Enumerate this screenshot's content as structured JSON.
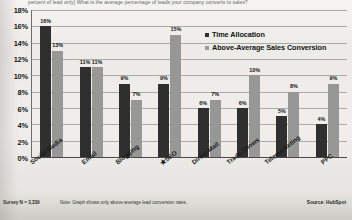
{
  "question": "percent of lead only)  What is the average percentage of leads your company converts to sales?",
  "footer": {
    "survey_n": "Survey N = 3,339",
    "note": "Note: Graph shows only above-average lead conversion rates.",
    "source": "Source: HubSpot"
  },
  "legend": {
    "position": "inside-top-right",
    "items": [
      {
        "label": "Time Allocation",
        "color": "#2f2f2f",
        "marker": "square-marker-dark"
      },
      {
        "label": "Above-Average Sales Conversion",
        "color": "#9d9d9b",
        "marker": "square-marker-gray"
      }
    ]
  },
  "chart_data": {
    "type": "bar",
    "title": "",
    "subtitle": "",
    "xlabel": "",
    "ylabel": "",
    "ylim": [
      0,
      18
    ],
    "ytick_labels": [
      "18%",
      "16%",
      "14%",
      "12%",
      "10%",
      "8%",
      "6%",
      "4%",
      "2%",
      "0%"
    ],
    "yticks": [
      18,
      16,
      14,
      12,
      10,
      8,
      6,
      4,
      2,
      0
    ],
    "grid": "horizontal",
    "legend_position": "upper right inside",
    "categories": [
      "Social Media",
      "Email",
      "Blogging",
      "SEO",
      "Direct Mail",
      "Trade Shows",
      "Telemarketing",
      "PPC"
    ],
    "category_marks": [
      "",
      "",
      "",
      "star",
      "",
      "",
      "",
      ""
    ],
    "series": [
      {
        "name": "Time Allocation",
        "color": "#2f2f2f",
        "values": [
          16,
          11,
          9,
          9,
          6,
          6,
          5,
          4
        ],
        "labels": [
          "16%",
          "11%",
          "9%",
          "9%",
          "6%",
          "6%",
          "5%",
          "4%"
        ]
      },
      {
        "name": "Above-Average Sales Conversion",
        "color": "#979795",
        "values": [
          13,
          11,
          7,
          15,
          7,
          10,
          8,
          9
        ],
        "labels": [
          "13%",
          "11%",
          "7%",
          "15%",
          "7%",
          "10%",
          "8%",
          "9%"
        ]
      }
    ]
  }
}
